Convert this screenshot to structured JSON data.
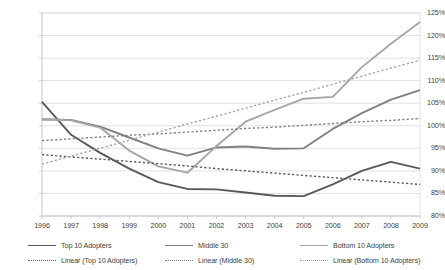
{
  "chart_data": {
    "type": "line",
    "title": "",
    "xlabel": "",
    "ylabel": "",
    "ylim": [
      80,
      125
    ],
    "ytick_step": 5,
    "ytick_labels": [
      "125%",
      "120%",
      "115%",
      "110%",
      "105%",
      "100%",
      "95%",
      "90%",
      "85%",
      "80%"
    ],
    "grid": true,
    "legend_position": "bottom",
    "x": [
      1996,
      1997,
      1998,
      1999,
      2000,
      2001,
      2002,
      2003,
      2004,
      2005,
      2006,
      2007,
      2008,
      2009
    ],
    "categories": [
      "1996",
      "1997",
      "1998",
      "1999",
      "2000",
      "2001",
      "2002",
      "2003",
      "2004",
      "2005",
      "2006",
      "2007",
      "2008",
      "2009"
    ],
    "series": [
      {
        "name": "Top 10 Adopters",
        "style": "solid",
        "color": "#595959",
        "values": [
          105.3,
          98.0,
          94.0,
          90.5,
          87.5,
          86.0,
          85.9,
          85.2,
          84.5,
          84.4,
          87.0,
          90.0,
          92.0,
          90.5
        ]
      },
      {
        "name": "Middle 30",
        "style": "solid",
        "color": "#808080",
        "values": [
          101.4,
          101.3,
          99.8,
          97.4,
          95.0,
          93.4,
          95.2,
          95.4,
          94.9,
          95.0,
          99.3,
          102.8,
          105.8,
          107.9
        ]
      },
      {
        "name": "Bottom 10 Adopters",
        "style": "solid",
        "color": "#a6a6a6",
        "values": [
          101.5,
          101.2,
          99.6,
          94.5,
          91.0,
          89.6,
          95.5,
          100.9,
          103.5,
          106.0,
          106.4,
          113.0,
          118.2,
          123.0
        ]
      },
      {
        "name": "Linear (Top 10 Adopters)",
        "style": "dotted",
        "color": "#595959",
        "values": [
          93.6,
          93.1,
          92.6,
          92.1,
          91.6,
          91.1,
          90.5,
          90.0,
          89.5,
          89.0,
          88.5,
          88.0,
          87.5,
          87.0
        ]
      },
      {
        "name": "Linear (Middle 30)",
        "style": "dotted",
        "color": "#808080",
        "values": [
          96.7,
          97.1,
          97.5,
          97.9,
          98.2,
          98.6,
          99.0,
          99.4,
          99.7,
          100.1,
          100.5,
          100.9,
          101.2,
          101.6
        ]
      },
      {
        "name": "Linear (Bottom 10 Adopters)",
        "style": "dotted",
        "color": "#a6a6a6",
        "values": [
          91.5,
          93.3,
          95.0,
          96.8,
          98.6,
          100.4,
          102.1,
          103.9,
          105.7,
          107.4,
          109.2,
          111.0,
          112.8,
          114.5
        ]
      }
    ]
  },
  "legend": {
    "rows": [
      [
        {
          "label": "Top 10 Adopters",
          "color": "#595959",
          "style": "solid"
        },
        {
          "label": "Middle 30",
          "color": "#808080",
          "style": "solid"
        },
        {
          "label": "Bottom 10 Adopters",
          "color": "#a6a6a6",
          "style": "solid"
        }
      ],
      [
        {
          "label": "Linear (Top 10 Adopters)",
          "color": "#595959",
          "style": "dotted"
        },
        {
          "label": "Linear (Middle 30)",
          "color": "#808080",
          "style": "dotted"
        },
        {
          "label": "Linear (Bottom 10 Adopters)",
          "color": "#a6a6a6",
          "style": "dotted"
        }
      ]
    ]
  },
  "axes": {
    "plot_border_color": "#bfbfbf",
    "gridline_color": "#d9d9d9"
  }
}
